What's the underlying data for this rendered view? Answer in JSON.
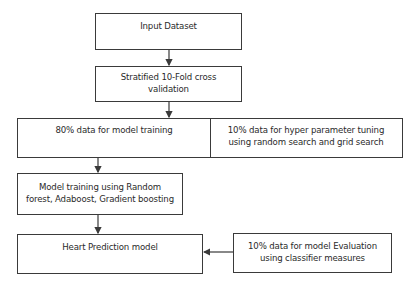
{
  "diagram": {
    "type": "flowchart",
    "nodes": {
      "input": {
        "label": "Input Dataset"
      },
      "cv": {
        "label_line1": "Stratified 10-Fold cross",
        "label_line2": "validation"
      },
      "split_train": {
        "label": "80% data for model training"
      },
      "split_tune": {
        "label_line1": "10% data for hyper parameter tuning",
        "label_line2": "using random search and grid search"
      },
      "training": {
        "label_line1": "Model training using Random",
        "label_line2": "forest, Adaboost, Gradient boosting"
      },
      "model": {
        "label": "Heart Prediction model"
      },
      "evaluation": {
        "label_line1": "10% data for model Evaluation",
        "label_line2": "using classifier measures"
      }
    },
    "edges": [
      {
        "from": "input",
        "to": "cv"
      },
      {
        "from": "cv",
        "to": "split"
      },
      {
        "from": "split_train",
        "to": "training"
      },
      {
        "from": "training",
        "to": "model"
      },
      {
        "from": "evaluation",
        "to": "model"
      }
    ],
    "colors": {
      "stroke": "#3a3a3a",
      "text": "#2a2a2a",
      "background": "#ffffff"
    }
  }
}
